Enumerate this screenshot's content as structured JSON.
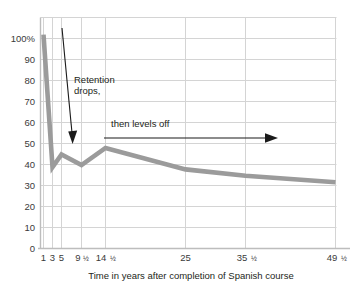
{
  "chart_data": {
    "type": "line",
    "title": "",
    "subtitle": "",
    "xlabel": "Time in years after completion of Spanish course",
    "ylabel": "",
    "x": [
      1,
      3,
      5,
      9.5,
      14.5,
      25,
      35.5,
      49.5
    ],
    "xtick_labels": [
      "1",
      "3",
      "5",
      "9½",
      "14½",
      "25",
      "35½",
      "49½"
    ],
    "xtick_whole": [
      "1",
      "3",
      "5",
      "9",
      "14",
      "25",
      "35",
      "49"
    ],
    "xtick_frac": [
      "",
      "",
      "",
      "1/2",
      "1/2",
      "",
      "1/2",
      "1/2"
    ],
    "ytick_labels": [
      "100%",
      "90",
      "80",
      "70",
      "60",
      "50",
      "40",
      "30",
      "20",
      "10",
      "0"
    ],
    "yticks": [
      100,
      90,
      80,
      70,
      60,
      50,
      40,
      30,
      20,
      10,
      0
    ],
    "ylim": [
      0,
      108
    ],
    "values": [
      100,
      38,
      44,
      39,
      47,
      37,
      34,
      31
    ],
    "series": [
      {
        "name": "Retention",
        "values": [
          100,
          38,
          44,
          39,
          47,
          37,
          34,
          31
        ]
      }
    ],
    "grid": true,
    "legend": "none",
    "line_color": "#9b9b9b",
    "grid_color": "#d4d4d4",
    "annotations": [
      {
        "id": "retention-drops",
        "text_line1": "Retention",
        "text_line2": "drops,",
        "arrow": "diagonal-down"
      },
      {
        "id": "then-levels-off",
        "text_line1": "then levels off",
        "text_line2": "",
        "arrow": "horizontal-right"
      }
    ]
  },
  "axis": {
    "x_title": "Time in years after completion of Spanish course"
  },
  "annotations": {
    "retention_line1": "Retention",
    "retention_line2": "drops,",
    "levels_off": "then levels off"
  },
  "ylabels": {
    "t0": "100%",
    "t1": "90",
    "t2": "80",
    "t3": "70",
    "t4": "60",
    "t5": "50",
    "t6": "40",
    "t7": "30",
    "t8": "20",
    "t9": "10",
    "t10": "0"
  },
  "xlabels": {
    "t0_num": "1",
    "t1_num": "3",
    "t2_num": "5",
    "t3_num": "9",
    "t3_frac": "½",
    "t4_num": "14",
    "t4_frac": "½",
    "t5_num": "25",
    "t6_num": "35",
    "t6_frac": "½",
    "t7_num": "49",
    "t7_frac": "½"
  }
}
